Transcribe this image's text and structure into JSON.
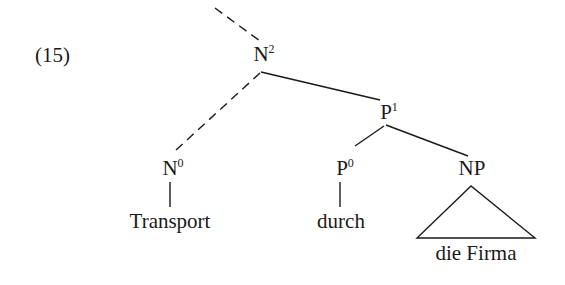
{
  "example_number": "(15)",
  "tree": {
    "root": {
      "label": "N",
      "sup": "2"
    },
    "p1": {
      "label": "P",
      "sup": "1"
    },
    "n0": {
      "label": "N",
      "sup": "0"
    },
    "p0": {
      "label": "P",
      "sup": "0"
    },
    "np": {
      "label": "NP",
      "sup": ""
    },
    "leaves": {
      "transport": "Transport",
      "durch": "durch",
      "die_firma": "die Firma"
    }
  },
  "edges": [
    {
      "from": "above",
      "to": "N2",
      "style": "dashed"
    },
    {
      "from": "N2",
      "to": "N0",
      "style": "dashed"
    },
    {
      "from": "N2",
      "to": "P1",
      "style": "solid"
    },
    {
      "from": "P1",
      "to": "P0",
      "style": "solid"
    },
    {
      "from": "P1",
      "to": "NP",
      "style": "solid"
    },
    {
      "from": "N0",
      "to": "Transport",
      "style": "solid"
    },
    {
      "from": "P0",
      "to": "durch",
      "style": "solid"
    },
    {
      "from": "NP",
      "to": "die Firma",
      "style": "triangle"
    }
  ],
  "colors": {
    "ink": "#1a1a1a",
    "background": "#ffffff"
  }
}
